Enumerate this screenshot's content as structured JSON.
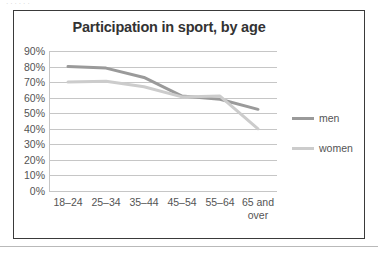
{
  "page": {
    "top_sliver_text": "· · · · · ·",
    "background_color": "#ffffff",
    "frame_color": "#3a3a3a",
    "rule_color": "#b9b9b9"
  },
  "chart_data": {
    "type": "line",
    "title": "Participation in sport, by age",
    "xlabel": "",
    "ylabel": "",
    "categories": [
      "18–24",
      "25–34",
      "35–44",
      "45–54",
      "55–64",
      "65 and over"
    ],
    "category_lines": [
      [
        "18–24"
      ],
      [
        "25–34"
      ],
      [
        "35–44"
      ],
      [
        "45–54"
      ],
      [
        "55–64"
      ],
      [
        "65 and",
        "over"
      ]
    ],
    "series": [
      {
        "name": "men",
        "color": "#9a9a9a",
        "width": 3.0,
        "values": [
          80,
          79,
          73,
          61,
          59,
          52.5
        ]
      },
      {
        "name": "women",
        "color": "#cccccc",
        "width": 3.0,
        "values": [
          70,
          70.5,
          67,
          60.5,
          61,
          40
        ]
      }
    ],
    "ylim": [
      0,
      90
    ],
    "ytick_values": [
      90,
      80,
      70,
      60,
      50,
      40,
      30,
      20,
      10,
      0
    ],
    "ytick_labels": [
      "90%",
      "80%",
      "70%",
      "60%",
      "50%",
      "40%",
      "30%",
      "20%",
      "10%",
      "0%"
    ],
    "grid": true,
    "grid_color": "#c6c6c6",
    "legend_position": "right",
    "legend_entries": [
      "men",
      "women"
    ]
  }
}
